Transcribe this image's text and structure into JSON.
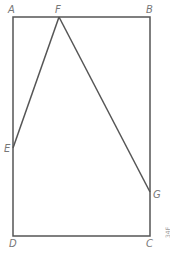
{
  "diagram": {
    "stroke_color": "#555555",
    "label_color": "#777777",
    "points": {
      "A": {
        "label": "A",
        "x": 13,
        "y": 17
      },
      "B": {
        "label": "B",
        "x": 150,
        "y": 17
      },
      "C": {
        "label": "C",
        "x": 150,
        "y": 236
      },
      "D": {
        "label": "D",
        "x": 13,
        "y": 236
      },
      "E": {
        "label": "E",
        "x": 13,
        "y": 148
      },
      "F": {
        "label": "F",
        "x": 59,
        "y": 17
      },
      "G": {
        "label": "G",
        "x": 150,
        "y": 192
      }
    },
    "segments": [
      [
        "A",
        "B"
      ],
      [
        "B",
        "C"
      ],
      [
        "C",
        "D"
      ],
      [
        "D",
        "A"
      ],
      [
        "E",
        "F"
      ],
      [
        "F",
        "G"
      ]
    ],
    "corner_tag": "34F"
  }
}
